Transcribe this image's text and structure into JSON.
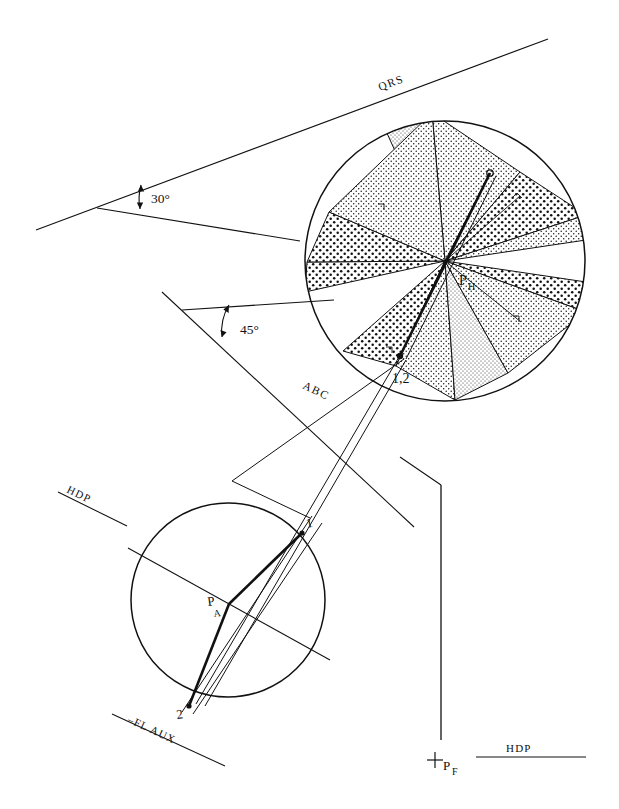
{
  "figure": {
    "type": "descriptive-geometry-construction",
    "background": "#ffffff",
    "ink": "#111111",
    "width": 619,
    "height": 809
  },
  "angles": {
    "upper": {
      "label": "30°",
      "value": 30,
      "unit": "degree"
    },
    "lower": {
      "label": "45°",
      "value": 45,
      "unit": "degree"
    }
  },
  "trace_labels": {
    "qrs": "QRS",
    "abc": "ABC",
    "hdp_upper_left": "HDP",
    "hdp_bottom_right": "HDP",
    "fl_aux": "–FL AUX"
  },
  "upper_circle": {
    "name": "horizontal-projection-circle",
    "center_label": "P",
    "center_sub": "H",
    "point_label": "1,2",
    "cx": 445,
    "cy": 261,
    "r": 141,
    "sector_count": 8
  },
  "lower_circle": {
    "name": "auxiliary-projection-circle",
    "center_label": "P",
    "center_sub": "A",
    "point_1": "1",
    "point_2": "2",
    "cx": 228,
    "cy": 600,
    "r": 97
  },
  "front_point": {
    "marker": "+",
    "label": "P",
    "sub": "F"
  }
}
